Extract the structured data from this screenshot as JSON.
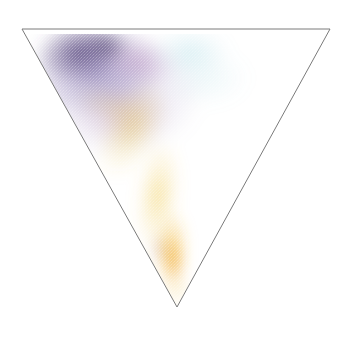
{
  "figure": {
    "title": "",
    "background_color": "#ffffff",
    "width": 351,
    "height": 343
  },
  "chart_data": {
    "type": "heatmap",
    "subtype": "ternary-density",
    "title": "",
    "subtitle": "",
    "xlabel": "",
    "ylabel": "",
    "legend": [],
    "annotations": [],
    "grid": false,
    "axes": {
      "outline_color": "#7a7a7a",
      "outline_width": 1,
      "shape": "inverted-triangle",
      "vertices": [
        {
          "name": "top-left",
          "x": 22,
          "y": 29
        },
        {
          "name": "top-right",
          "x": 330,
          "y": 29
        },
        {
          "name": "bottom",
          "x": 177,
          "y": 307
        }
      ],
      "tick_labels": [],
      "axis_range_note": ""
    },
    "blobs": [
      {
        "name": "purple-core-upper-left",
        "cx": 78,
        "cy": 52,
        "rx": 44,
        "ry": 30,
        "color": "#4e3d76",
        "peak_alpha": 0.82,
        "rotation": -8
      },
      {
        "name": "violet-cloud-upper-left",
        "cx": 96,
        "cy": 70,
        "rx": 70,
        "ry": 48,
        "color": "#7b6aa8",
        "peak_alpha": 0.62,
        "rotation": -10
      },
      {
        "name": "deep-violet-spot",
        "cx": 106,
        "cy": 46,
        "rx": 26,
        "ry": 17,
        "color": "#3f2f63",
        "peak_alpha": 0.7,
        "rotation": 0
      },
      {
        "name": "lavender-halo",
        "cx": 118,
        "cy": 96,
        "rx": 88,
        "ry": 64,
        "color": "#a796c9",
        "peak_alpha": 0.45,
        "rotation": -6
      },
      {
        "name": "magenta-tint-center",
        "cx": 140,
        "cy": 62,
        "rx": 40,
        "ry": 26,
        "color": "#b07bb4",
        "peak_alpha": 0.38,
        "rotation": 12
      },
      {
        "name": "mauve-tint-lower-cloud",
        "cx": 122,
        "cy": 116,
        "rx": 52,
        "ry": 32,
        "color": "#c08faa",
        "peak_alpha": 0.3,
        "rotation": 0
      },
      {
        "name": "cyan-tint-top-right",
        "cx": 190,
        "cy": 52,
        "rx": 42,
        "ry": 26,
        "color": "#77c6d4",
        "peak_alpha": 0.26,
        "rotation": 0
      },
      {
        "name": "pale-cyan-wash",
        "cx": 205,
        "cy": 78,
        "rx": 46,
        "ry": 30,
        "color": "#8fd0d8",
        "peak_alpha": 0.16,
        "rotation": 0
      },
      {
        "name": "yellow-diagonal-streak",
        "cx": 132,
        "cy": 128,
        "rx": 30,
        "ry": 54,
        "color": "#e8c23c",
        "peak_alpha": 0.4,
        "rotation": 28
      },
      {
        "name": "yellow-plume-mid",
        "cx": 158,
        "cy": 196,
        "rx": 22,
        "ry": 58,
        "color": "#f0c84a",
        "peak_alpha": 0.52,
        "rotation": 6
      },
      {
        "name": "gold-core-lower",
        "cx": 172,
        "cy": 250,
        "rx": 15,
        "ry": 40,
        "color": "#f2b32a",
        "peak_alpha": 0.8,
        "rotation": 2
      },
      {
        "name": "orange-hot-spot",
        "cx": 174,
        "cy": 262,
        "rx": 9,
        "ry": 22,
        "color": "#ef9c18",
        "peak_alpha": 0.85,
        "rotation": 0
      },
      {
        "name": "red-brown-streak",
        "cx": 159,
        "cy": 249,
        "rx": 4,
        "ry": 20,
        "color": "#a0502c",
        "peak_alpha": 0.72,
        "rotation": -3
      },
      {
        "name": "pale-yellow-tail-bottom",
        "cx": 176,
        "cy": 288,
        "rx": 14,
        "ry": 20,
        "color": "#f5d88a",
        "peak_alpha": 0.45,
        "rotation": 0
      },
      {
        "name": "faint-yellow-upper-band",
        "cx": 112,
        "cy": 106,
        "rx": 40,
        "ry": 18,
        "color": "#e9d36a",
        "peak_alpha": 0.26,
        "rotation": 18
      }
    ],
    "colors": {
      "purple_dark": "#4e3d76",
      "violet": "#7b6aa8",
      "lavender": "#a796c9",
      "magenta": "#b07bb4",
      "cyan": "#77c6d4",
      "yellow": "#f0c84a",
      "orange": "#ef9c18",
      "red_brown": "#a0502c",
      "outline": "#7a7a7a",
      "background": "#ffffff"
    }
  }
}
